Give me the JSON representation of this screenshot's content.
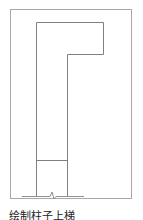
{
  "diagram": {
    "type": "architectural-sketch",
    "stroke_color": "#888888",
    "frame_color": "#a0a0a0"
  },
  "caption": "绘制柱子上梯"
}
